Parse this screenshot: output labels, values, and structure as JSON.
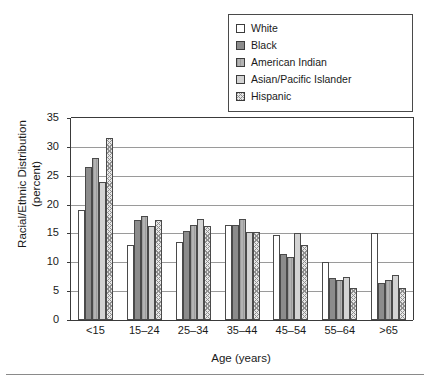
{
  "chart_data": {
    "type": "bar",
    "title": "",
    "xlabel": "Age (years)",
    "ylabel": "Racial/Ethnic Distribution (percent)",
    "ylabel_line1": "Racial/Ethnic Distribution",
    "ylabel_line2": "(percent)",
    "categories": [
      "<15",
      "15–24",
      "25–34",
      "35–44",
      "45–54",
      "55–64",
      ">65"
    ],
    "ylim": [
      0,
      35
    ],
    "yticks": [
      0,
      5,
      10,
      15,
      20,
      25,
      30,
      35
    ],
    "grid": true,
    "legend_position": "top-right",
    "series": [
      {
        "name": "White",
        "values": [
          19.0,
          13.0,
          13.5,
          16.5,
          14.7,
          10.0,
          15.0
        ]
      },
      {
        "name": "Black",
        "values": [
          26.5,
          17.3,
          15.5,
          16.5,
          11.5,
          7.3,
          6.5
        ]
      },
      {
        "name": "American Indian",
        "values": [
          28.0,
          18.0,
          16.5,
          17.5,
          11.0,
          7.0,
          7.0
        ]
      },
      {
        "name": "Asian/Pacific Islander",
        "values": [
          24.0,
          16.3,
          17.5,
          15.3,
          15.0,
          7.5,
          7.8
        ]
      },
      {
        "name": "Hispanic",
        "values": [
          31.5,
          17.3,
          16.3,
          15.3,
          13.0,
          5.5,
          5.5
        ]
      }
    ]
  },
  "legend": {
    "items": [
      {
        "label": "White",
        "swatch": "white-swatch-icon"
      },
      {
        "label": "Black",
        "swatch": "black-swatch-icon"
      },
      {
        "label": "American Indian",
        "swatch": "american-indian-swatch-icon"
      },
      {
        "label": "Asian/Pacific Islander",
        "swatch": "asian-pacific-islander-swatch-icon"
      },
      {
        "label": "Hispanic",
        "swatch": "hispanic-swatch-icon"
      }
    ]
  },
  "colors": {
    "white": "#ffffff",
    "black": "#8c8c8c",
    "american_indian": "#b3b3b3",
    "asian_pacific_islander": "#d3d3d3",
    "hispanic": "#e8e8e8",
    "axis": "#3a3a3a",
    "grid": "#9a9a9a"
  }
}
